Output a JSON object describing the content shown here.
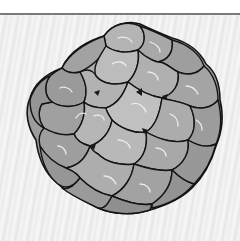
{
  "image": {
    "subject": "virus-capsid-illustration",
    "description": "Grayscale illustration of a lumpy, roughly spherical virus capsid made of rounded protein subunits outlined in black, on a light streaked gray background below a thin gray horizontal rule.",
    "colors": {
      "background_top": "#ffffff",
      "rule": "#7a7a7a",
      "background": "#eeeeee",
      "subunit_fill": "#a9a9a9",
      "subunit_dark": "#8a8a8a",
      "subunit_light": "#c4c4c4",
      "outline": "#141414",
      "highlight": "#f2f2f2"
    }
  }
}
